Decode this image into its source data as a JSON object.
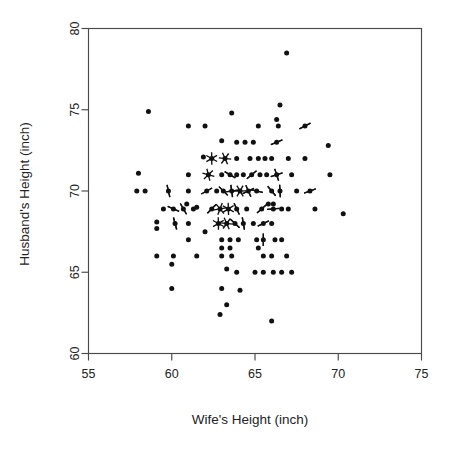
{
  "chart_data": {
    "type": "scatter",
    "title": "",
    "subtitle": "",
    "xlabel": "Wife's Height (inch)",
    "ylabel": "Husband's Height (inch)",
    "xlim": [
      55,
      75
    ],
    "ylim": [
      60,
      80
    ],
    "xticks": [
      55,
      60,
      65,
      70,
      75
    ],
    "yticks": [
      60,
      65,
      70,
      75,
      80
    ],
    "xtick_labels": [
      "55",
      "60",
      "65",
      "70",
      "75"
    ],
    "ytick_labels": [
      "60",
      "65",
      "70",
      "75",
      "80"
    ],
    "grid": false,
    "legend": null,
    "annotations": [],
    "marker_style": "sunflower",
    "marker_note": "Overlapping observations drawn as sunflower petals; petal count equals number of coincident observations.",
    "point_color": "#111111",
    "axis_color": "#4a4a4a",
    "text_color": "#232323",
    "n_observations": 275,
    "points": [
      {
        "x": 66.9,
        "y": 78.5,
        "n": 1
      },
      {
        "x": 66.5,
        "y": 75.3,
        "n": 1
      },
      {
        "x": 58.6,
        "y": 74.9,
        "n": 1
      },
      {
        "x": 63.6,
        "y": 74.8,
        "n": 1
      },
      {
        "x": 66.3,
        "y": 74.4,
        "n": 1
      },
      {
        "x": 61.0,
        "y": 74.0,
        "n": 1
      },
      {
        "x": 62.0,
        "y": 74.0,
        "n": 1
      },
      {
        "x": 65.2,
        "y": 74.0,
        "n": 1
      },
      {
        "x": 66.4,
        "y": 74.0,
        "n": 1
      },
      {
        "x": 68.0,
        "y": 74.0,
        "n": 2
      },
      {
        "x": 63.0,
        "y": 73.1,
        "n": 1
      },
      {
        "x": 63.9,
        "y": 73.0,
        "n": 1
      },
      {
        "x": 64.4,
        "y": 73.0,
        "n": 1
      },
      {
        "x": 64.9,
        "y": 73.0,
        "n": 1
      },
      {
        "x": 66.3,
        "y": 73.0,
        "n": 2
      },
      {
        "x": 69.4,
        "y": 72.8,
        "n": 1
      },
      {
        "x": 61.9,
        "y": 72.1,
        "n": 1
      },
      {
        "x": 62.4,
        "y": 72.0,
        "n": 3
      },
      {
        "x": 63.2,
        "y": 72.0,
        "n": 3
      },
      {
        "x": 63.9,
        "y": 72.0,
        "n": 1
      },
      {
        "x": 64.7,
        "y": 72.0,
        "n": 1
      },
      {
        "x": 65.2,
        "y": 72.0,
        "n": 1
      },
      {
        "x": 65.6,
        "y": 72.0,
        "n": 1
      },
      {
        "x": 66.0,
        "y": 72.0,
        "n": 1
      },
      {
        "x": 67.0,
        "y": 72.0,
        "n": 1
      },
      {
        "x": 68.0,
        "y": 72.0,
        "n": 1
      },
      {
        "x": 58.0,
        "y": 71.1,
        "n": 1
      },
      {
        "x": 61.0,
        "y": 71.0,
        "n": 1
      },
      {
        "x": 62.2,
        "y": 71.0,
        "n": 3
      },
      {
        "x": 63.0,
        "y": 71.0,
        "n": 1
      },
      {
        "x": 63.5,
        "y": 71.0,
        "n": 2
      },
      {
        "x": 63.9,
        "y": 71.0,
        "n": 1
      },
      {
        "x": 64.3,
        "y": 71.0,
        "n": 1
      },
      {
        "x": 64.8,
        "y": 71.0,
        "n": 2
      },
      {
        "x": 65.3,
        "y": 71.0,
        "n": 1
      },
      {
        "x": 65.7,
        "y": 71.0,
        "n": 1
      },
      {
        "x": 66.3,
        "y": 71.0,
        "n": 4
      },
      {
        "x": 67.2,
        "y": 71.0,
        "n": 1
      },
      {
        "x": 69.5,
        "y": 71.0,
        "n": 1
      },
      {
        "x": 57.9,
        "y": 70.0,
        "n": 1
      },
      {
        "x": 58.4,
        "y": 70.0,
        "n": 1
      },
      {
        "x": 59.8,
        "y": 70.0,
        "n": 2
      },
      {
        "x": 61.0,
        "y": 70.0,
        "n": 1
      },
      {
        "x": 62.1,
        "y": 70.0,
        "n": 2
      },
      {
        "x": 62.7,
        "y": 70.0,
        "n": 1
      },
      {
        "x": 63.1,
        "y": 70.0,
        "n": 2
      },
      {
        "x": 63.6,
        "y": 70.0,
        "n": 4
      },
      {
        "x": 64.1,
        "y": 70.0,
        "n": 3
      },
      {
        "x": 64.6,
        "y": 70.0,
        "n": 4
      },
      {
        "x": 65.1,
        "y": 70.0,
        "n": 2
      },
      {
        "x": 66.0,
        "y": 70.0,
        "n": 2
      },
      {
        "x": 66.5,
        "y": 70.0,
        "n": 2
      },
      {
        "x": 67.5,
        "y": 70.0,
        "n": 1
      },
      {
        "x": 68.3,
        "y": 70.0,
        "n": 2
      },
      {
        "x": 60.9,
        "y": 69.2,
        "n": 1
      },
      {
        "x": 61.5,
        "y": 69.0,
        "n": 1
      },
      {
        "x": 65.8,
        "y": 69.2,
        "n": 1
      },
      {
        "x": 66.1,
        "y": 69.2,
        "n": 1
      },
      {
        "x": 59.5,
        "y": 68.9,
        "n": 1
      },
      {
        "x": 60.1,
        "y": 68.9,
        "n": 2
      },
      {
        "x": 60.7,
        "y": 68.9,
        "n": 2
      },
      {
        "x": 61.3,
        "y": 68.9,
        "n": 1
      },
      {
        "x": 62.4,
        "y": 68.9,
        "n": 2
      },
      {
        "x": 62.9,
        "y": 68.9,
        "n": 3
      },
      {
        "x": 63.4,
        "y": 68.9,
        "n": 3
      },
      {
        "x": 63.9,
        "y": 68.9,
        "n": 2
      },
      {
        "x": 64.5,
        "y": 68.9,
        "n": 1
      },
      {
        "x": 65.4,
        "y": 68.9,
        "n": 2
      },
      {
        "x": 66.1,
        "y": 68.9,
        "n": 2
      },
      {
        "x": 66.6,
        "y": 68.9,
        "n": 1
      },
      {
        "x": 67.0,
        "y": 68.9,
        "n": 1
      },
      {
        "x": 68.6,
        "y": 68.9,
        "n": 1
      },
      {
        "x": 70.3,
        "y": 68.6,
        "n": 1
      },
      {
        "x": 59.1,
        "y": 68.1,
        "n": 1
      },
      {
        "x": 59.1,
        "y": 67.7,
        "n": 1
      },
      {
        "x": 60.2,
        "y": 68.0,
        "n": 2
      },
      {
        "x": 61.0,
        "y": 68.0,
        "n": 1
      },
      {
        "x": 62.8,
        "y": 68.0,
        "n": 3
      },
      {
        "x": 63.3,
        "y": 68.0,
        "n": 3
      },
      {
        "x": 63.8,
        "y": 68.0,
        "n": 2
      },
      {
        "x": 64.3,
        "y": 68.0,
        "n": 2
      },
      {
        "x": 64.9,
        "y": 68.0,
        "n": 1
      },
      {
        "x": 65.5,
        "y": 68.0,
        "n": 2
      },
      {
        "x": 66.0,
        "y": 68.0,
        "n": 1
      },
      {
        "x": 62.0,
        "y": 67.5,
        "n": 1
      },
      {
        "x": 61.0,
        "y": 67.0,
        "n": 1
      },
      {
        "x": 63.0,
        "y": 67.0,
        "n": 1
      },
      {
        "x": 63.5,
        "y": 67.0,
        "n": 1
      },
      {
        "x": 64.0,
        "y": 67.0,
        "n": 1
      },
      {
        "x": 65.1,
        "y": 67.0,
        "n": 1
      },
      {
        "x": 65.5,
        "y": 67.0,
        "n": 2
      },
      {
        "x": 66.2,
        "y": 67.0,
        "n": 1
      },
      {
        "x": 66.6,
        "y": 67.0,
        "n": 1
      },
      {
        "x": 63.0,
        "y": 66.5,
        "n": 1
      },
      {
        "x": 63.5,
        "y": 66.5,
        "n": 1
      },
      {
        "x": 65.2,
        "y": 66.5,
        "n": 1
      },
      {
        "x": 59.1,
        "y": 66.0,
        "n": 1
      },
      {
        "x": 60.1,
        "y": 66.0,
        "n": 1
      },
      {
        "x": 61.5,
        "y": 66.0,
        "n": 1
      },
      {
        "x": 63.0,
        "y": 66.0,
        "n": 1
      },
      {
        "x": 63.6,
        "y": 66.0,
        "n": 1
      },
      {
        "x": 65.5,
        "y": 66.0,
        "n": 1
      },
      {
        "x": 66.0,
        "y": 66.0,
        "n": 1
      },
      {
        "x": 66.9,
        "y": 66.0,
        "n": 1
      },
      {
        "x": 60.0,
        "y": 65.5,
        "n": 1
      },
      {
        "x": 63.3,
        "y": 65.2,
        "n": 1
      },
      {
        "x": 63.9,
        "y": 65.0,
        "n": 1
      },
      {
        "x": 65.0,
        "y": 65.0,
        "n": 1
      },
      {
        "x": 65.5,
        "y": 65.0,
        "n": 1
      },
      {
        "x": 66.1,
        "y": 65.0,
        "n": 1
      },
      {
        "x": 66.6,
        "y": 65.0,
        "n": 1
      },
      {
        "x": 67.2,
        "y": 65.0,
        "n": 1
      },
      {
        "x": 60.0,
        "y": 64.0,
        "n": 1
      },
      {
        "x": 63.0,
        "y": 64.0,
        "n": 1
      },
      {
        "x": 64.1,
        "y": 63.9,
        "n": 1
      },
      {
        "x": 63.3,
        "y": 63.0,
        "n": 1
      },
      {
        "x": 62.9,
        "y": 62.4,
        "n": 1
      },
      {
        "x": 66.0,
        "y": 62.0,
        "n": 1
      }
    ]
  },
  "axes": {
    "x_title": "Wife's Height (inch)",
    "y_title": "Husband's Height (inch)"
  }
}
